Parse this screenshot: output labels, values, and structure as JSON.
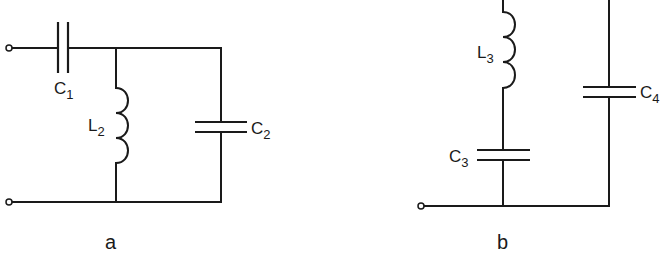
{
  "diagrams": [
    {
      "id": "a",
      "caption": "a",
      "components": [
        {
          "type": "capacitor",
          "label": "C",
          "subscript": "1",
          "connection": "series, top wire"
        },
        {
          "type": "inductor",
          "label": "L",
          "subscript": "2",
          "connection": "shunt"
        },
        {
          "type": "capacitor",
          "label": "C",
          "subscript": "2",
          "connection": "shunt"
        }
      ],
      "terminals": 2
    },
    {
      "id": "b",
      "caption": "b",
      "components": [
        {
          "type": "inductor",
          "label": "L",
          "subscript": "3",
          "connection": "series with C3, shunt branch"
        },
        {
          "type": "capacitor",
          "label": "C",
          "subscript": "3",
          "connection": "series with L3, shunt branch"
        },
        {
          "type": "capacitor",
          "label": "C",
          "subscript": "4",
          "connection": "right branch"
        }
      ],
      "terminals": 1
    }
  ],
  "colors": {
    "ink": "#1a1a1a",
    "background": "#ffffff"
  }
}
